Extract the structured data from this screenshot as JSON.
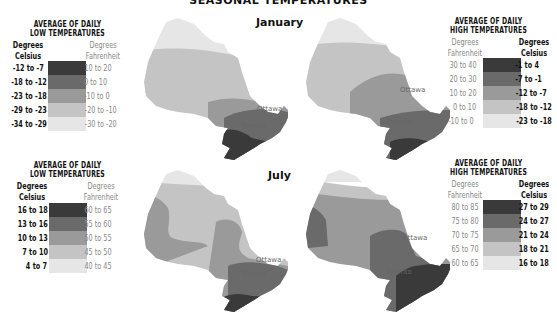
{
  "title": "SEASONAL TEMPERATURES",
  "seasons": {
    "january": "January",
    "july": "July"
  },
  "colors": {
    "level1": "#3a3a3a",
    "level2": "#6a6a6a",
    "level3": "#9a9a9a",
    "level4": "#c4c4c4",
    "level5": "#e6e6e6"
  },
  "cities": {
    "ottawa": "Ottawa",
    "toronto": "Toronto"
  },
  "legends": {
    "jan_low": {
      "title1": "AVERAGE OF DAILY",
      "title2": "LOW TEMPERATURES",
      "celsius_header1": "Degrees",
      "celsius_header2": "Celsius",
      "fahrenheit_header1": "Degrees",
      "fahrenheit_header2": "Fahrenheit",
      "rows": [
        {
          "celsius": "-12 to -7",
          "fahrenheit": "10 to 20"
        },
        {
          "celsius": "-18 to -12",
          "fahrenheit": "0 to 10"
        },
        {
          "celsius": "-23 to -18",
          "fahrenheit": "-10 to 0"
        },
        {
          "celsius": "-29 to -23",
          "fahrenheit": "-20 to -10"
        },
        {
          "celsius": "-34 to -29",
          "fahrenheit": "-30 to -20"
        }
      ]
    },
    "jan_high": {
      "title1": "AVERAGE OF DAILY",
      "title2": "HIGH TEMPERATURES",
      "celsius_header1": "Degrees",
      "celsius_header2": "Celsius",
      "fahrenheit_header1": "Degrees",
      "fahrenheit_header2": "Fahrenheit",
      "rows": [
        {
          "celsius": "-1 to 4",
          "fahrenheit": "30 to 40"
        },
        {
          "celsius": "-7 to -1",
          "fahrenheit": "20 to 30"
        },
        {
          "celsius": "-12 to -7",
          "fahrenheit": "10 to 20"
        },
        {
          "celsius": "-18 to -12",
          "fahrenheit": "0 to 10"
        },
        {
          "celsius": "-23 to -18",
          "fahrenheit": "-10 to 0"
        }
      ]
    },
    "jul_low": {
      "title1": "AVERAGE OF DAILY",
      "title2": "LOW TEMPERATURES",
      "celsius_header1": "Degrees",
      "celsius_header2": "Celsius",
      "fahrenheit_header1": "Degrees",
      "fahrenheit_header2": "Fahrenheit",
      "rows": [
        {
          "celsius": "16 to 18",
          "fahrenheit": "60 to 65"
        },
        {
          "celsius": "13 to 16",
          "fahrenheit": "55 to 60"
        },
        {
          "celsius": "10 to 13",
          "fahrenheit": "50 to 55"
        },
        {
          "celsius": "7 to 10",
          "fahrenheit": "45 to 50"
        },
        {
          "celsius": "4 to 7",
          "fahrenheit": "40 to 45"
        }
      ]
    },
    "jul_high": {
      "title1": "AVERAGE OF DAILY",
      "title2": "HIGH TEMPERATURES",
      "celsius_header1": "Degrees",
      "celsius_header2": "Celsius",
      "fahrenheit_header1": "Degrees",
      "fahrenheit_header2": "Fahrenheit",
      "rows": [
        {
          "celsius": "27 to 29",
          "fahrenheit": "80 to 85"
        },
        {
          "celsius": "24 to 27",
          "fahrenheit": "75 to 80"
        },
        {
          "celsius": "21 to 24",
          "fahrenheit": "70 to 75"
        },
        {
          "celsius": "18 to 21",
          "fahrenheit": "65 to 70"
        },
        {
          "celsius": "16 to 18",
          "fahrenheit": "60 to 65"
        }
      ]
    }
  }
}
